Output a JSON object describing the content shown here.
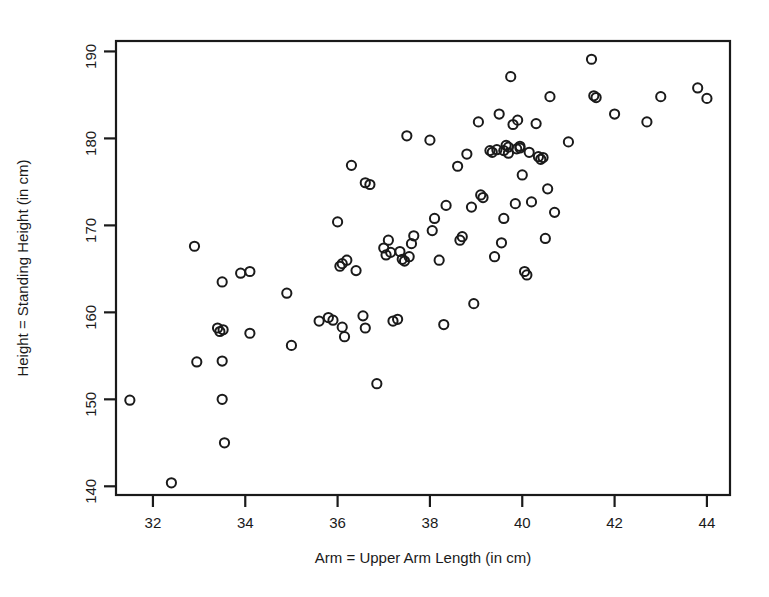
{
  "chart_data": {
    "type": "scatter",
    "title": "",
    "xlabel": "Arm = Upper Arm Length (in cm)",
    "ylabel": "Height = Standing Height (in cm)",
    "xlim": [
      31.2,
      44.5
    ],
    "ylim": [
      139.0,
      191.2
    ],
    "xticks": [
      32,
      34,
      36,
      38,
      40,
      42,
      44
    ],
    "yticks": [
      140,
      150,
      160,
      170,
      180,
      190
    ],
    "grid": false,
    "legend": null,
    "marker": "open-circle",
    "marker_color": "#1a1a1a",
    "n_points": 100,
    "points": [
      [
        31.5,
        149.9
      ],
      [
        32.4,
        140.4
      ],
      [
        32.9,
        167.6
      ],
      [
        32.95,
        154.3
      ],
      [
        33.4,
        158.2
      ],
      [
        33.45,
        157.8
      ],
      [
        33.5,
        163.5
      ],
      [
        33.5,
        154.4
      ],
      [
        33.5,
        150.0
      ],
      [
        33.55,
        145.0
      ],
      [
        33.9,
        164.5
      ],
      [
        34.1,
        164.7
      ],
      [
        34.1,
        157.6
      ],
      [
        34.9,
        162.2
      ],
      [
        35.0,
        156.2
      ],
      [
        35.6,
        159.0
      ],
      [
        35.8,
        159.4
      ],
      [
        36.0,
        170.4
      ],
      [
        36.1,
        165.6
      ],
      [
        36.1,
        158.3
      ],
      [
        36.15,
        157.2
      ],
      [
        36.2,
        166.0
      ],
      [
        36.3,
        176.9
      ],
      [
        36.4,
        164.8
      ],
      [
        36.55,
        159.6
      ],
      [
        36.6,
        158.2
      ],
      [
        36.6,
        174.9
      ],
      [
        36.85,
        151.8
      ],
      [
        37.0,
        167.4
      ],
      [
        37.1,
        168.3
      ],
      [
        37.15,
        166.9
      ],
      [
        37.2,
        159.0
      ],
      [
        37.3,
        159.2
      ],
      [
        37.35,
        167.0
      ],
      [
        37.4,
        166.1
      ],
      [
        37.45,
        165.9
      ],
      [
        37.5,
        180.3
      ],
      [
        37.6,
        167.9
      ],
      [
        37.65,
        168.8
      ],
      [
        38.0,
        179.8
      ],
      [
        38.05,
        169.4
      ],
      [
        38.1,
        170.8
      ],
      [
        38.2,
        166.0
      ],
      [
        38.3,
        158.6
      ],
      [
        38.6,
        176.8
      ],
      [
        38.65,
        168.3
      ],
      [
        38.7,
        168.7
      ],
      [
        38.8,
        178.2
      ],
      [
        38.9,
        172.1
      ],
      [
        38.95,
        161.0
      ],
      [
        39.05,
        181.9
      ],
      [
        39.1,
        173.5
      ],
      [
        39.15,
        173.2
      ],
      [
        39.3,
        178.6
      ],
      [
        39.35,
        178.4
      ],
      [
        39.4,
        166.4
      ],
      [
        39.5,
        182.8
      ],
      [
        39.55,
        168.0
      ],
      [
        39.6,
        170.8
      ],
      [
        39.65,
        179.2
      ],
      [
        39.7,
        179.0
      ],
      [
        39.7,
        178.3
      ],
      [
        39.75,
        187.1
      ],
      [
        39.8,
        181.6
      ],
      [
        39.85,
        172.5
      ],
      [
        39.9,
        182.1
      ],
      [
        39.95,
        179.1
      ],
      [
        39.95,
        178.9
      ],
      [
        40.0,
        175.8
      ],
      [
        40.05,
        164.7
      ],
      [
        40.1,
        164.3
      ],
      [
        40.15,
        178.4
      ],
      [
        40.2,
        172.7
      ],
      [
        40.3,
        181.7
      ],
      [
        40.35,
        177.9
      ],
      [
        40.4,
        177.6
      ],
      [
        40.5,
        168.5
      ],
      [
        40.55,
        174.2
      ],
      [
        40.6,
        184.8
      ],
      [
        40.7,
        171.5
      ],
      [
        41.0,
        179.6
      ],
      [
        41.5,
        189.1
      ],
      [
        41.6,
        184.7
      ],
      [
        42.0,
        182.8
      ],
      [
        42.7,
        181.9
      ],
      [
        43.0,
        184.8
      ],
      [
        43.8,
        185.8
      ],
      [
        44.0,
        184.6
      ],
      [
        37.05,
        166.6
      ],
      [
        39.45,
        178.7
      ],
      [
        39.6,
        178.6
      ],
      [
        36.05,
        165.3
      ],
      [
        33.52,
        158.0
      ],
      [
        40.45,
        177.8
      ],
      [
        38.35,
        172.3
      ],
      [
        37.55,
        166.4
      ],
      [
        41.55,
        184.9
      ],
      [
        35.9,
        159.1
      ],
      [
        36.7,
        174.7
      ],
      [
        39.88,
        178.8
      ]
    ]
  },
  "axes": {
    "x_tick_labels": [
      "32",
      "34",
      "36",
      "38",
      "40",
      "42",
      "44"
    ],
    "y_tick_labels": [
      "140",
      "150",
      "160",
      "170",
      "180",
      "190"
    ],
    "x_axis_title": "Arm = Upper Arm Length (in cm)",
    "y_axis_title": "Height = Standing Height (in cm)"
  }
}
